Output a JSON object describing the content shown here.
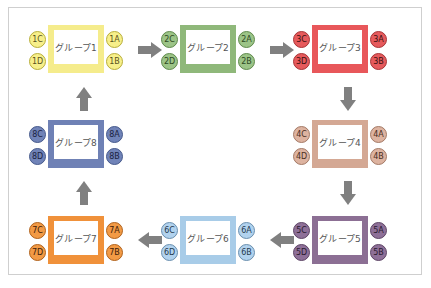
{
  "diagram": {
    "type": "group rotation flow",
    "groups": [
      {
        "id": "g1",
        "label": "グループ1",
        "seats": {
          "a": "1A",
          "b": "1B",
          "c": "1C",
          "d": "1D"
        },
        "border": "#f5ec8c",
        "seat_fill": "#f7ef8a",
        "seat_border": "#b8ae3a",
        "seat_text": "#5a5320",
        "x": 32,
        "y": 25
      },
      {
        "id": "g2",
        "label": "グループ2",
        "seats": {
          "a": "2A",
          "b": "2B",
          "c": "2C",
          "d": "2D"
        },
        "border": "#8fb87a",
        "seat_fill": "#9cc487",
        "seat_border": "#5f8a4c",
        "seat_text": "#2f4a24",
        "x": 164,
        "y": 25
      },
      {
        "id": "g3",
        "label": "グループ3",
        "seats": {
          "a": "3A",
          "b": "3B",
          "c": "3C",
          "d": "3D"
        },
        "border": "#e8575a",
        "seat_fill": "#e65a5c",
        "seat_border": "#a83436",
        "seat_text": "#3a1010",
        "x": 296,
        "y": 25
      },
      {
        "id": "g4",
        "label": "グループ4",
        "seats": {
          "a": "4A",
          "b": "4B",
          "c": "4C",
          "d": "4D"
        },
        "border": "#d4a894",
        "seat_fill": "#ddb3a0",
        "seat_border": "#a47a66",
        "seat_text": "#4a2e22",
        "x": 296,
        "y": 120
      },
      {
        "id": "g5",
        "label": "グループ5",
        "seats": {
          "a": "5A",
          "b": "5B",
          "c": "5C",
          "d": "5D"
        },
        "border": "#8c6f94",
        "seat_fill": "#8e7098",
        "seat_border": "#5e4566",
        "seat_text": "#2a1a30",
        "x": 296,
        "y": 216
      },
      {
        "id": "g6",
        "label": "グループ6",
        "seats": {
          "a": "6A",
          "b": "6B",
          "c": "6C",
          "d": "6D"
        },
        "border": "#a8cce8",
        "seat_fill": "#b1d2ee",
        "seat_border": "#6a8fae",
        "seat_text": "#263a4e",
        "x": 164,
        "y": 216
      },
      {
        "id": "g7",
        "label": "グループ7",
        "seats": {
          "a": "7A",
          "b": "7B",
          "c": "7C",
          "d": "7D"
        },
        "border": "#f0913a",
        "seat_fill": "#f29a45",
        "seat_border": "#b0621c",
        "seat_text": "#3e200a",
        "x": 32,
        "y": 216
      },
      {
        "id": "g8",
        "label": "グループ8",
        "seats": {
          "a": "8A",
          "b": "8B",
          "c": "8C",
          "d": "8D"
        },
        "border": "#6f81b5",
        "seat_fill": "#7083b8",
        "seat_border": "#465a8c",
        "seat_text": "#1a2240",
        "x": 32,
        "y": 120
      }
    ],
    "arrows": [
      {
        "from": "g1",
        "to": "g2",
        "direction": "right"
      },
      {
        "from": "g2",
        "to": "g3",
        "direction": "right"
      },
      {
        "from": "g3",
        "to": "g4",
        "direction": "down"
      },
      {
        "from": "g4",
        "to": "g5",
        "direction": "down"
      },
      {
        "from": "g5",
        "to": "g6",
        "direction": "left"
      },
      {
        "from": "g6",
        "to": "g7",
        "direction": "left"
      },
      {
        "from": "g7",
        "to": "g8",
        "direction": "up"
      },
      {
        "from": "g8",
        "to": "g1",
        "direction": "up"
      }
    ],
    "arrow_color": "#808080",
    "frame_border": "#cfcfcf"
  }
}
